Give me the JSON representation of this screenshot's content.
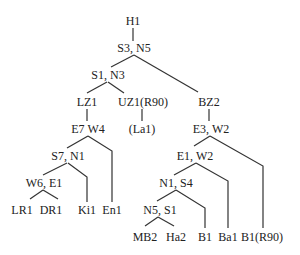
{
  "tree": {
    "nodes": [
      {
        "id": "h1",
        "label": "H1"
      },
      {
        "id": "s3n5",
        "label": "S3, N5"
      },
      {
        "id": "s1n3",
        "label": "S1, N3"
      },
      {
        "id": "lz1",
        "label": "LZ1"
      },
      {
        "id": "uz1",
        "label": "UZ1(R90)"
      },
      {
        "id": "bz2",
        "label": "BZ2"
      },
      {
        "id": "e7w4",
        "label": "E7 W4"
      },
      {
        "id": "la1",
        "label": "(La1)"
      },
      {
        "id": "e3w2",
        "label": "E3, W2"
      },
      {
        "id": "s7n1",
        "label": "S7, N1"
      },
      {
        "id": "e1w2",
        "label": "E1, W2"
      },
      {
        "id": "w6e1",
        "label": "W6, E1"
      },
      {
        "id": "n1s4",
        "label": "N1, S4"
      },
      {
        "id": "lr1",
        "label": "LR1"
      },
      {
        "id": "dr1",
        "label": "DR1"
      },
      {
        "id": "ki1",
        "label": "Ki1"
      },
      {
        "id": "en1",
        "label": "En1"
      },
      {
        "id": "n5s1",
        "label": "N5, S1"
      },
      {
        "id": "mb2",
        "label": "MB2"
      },
      {
        "id": "ha2",
        "label": "Ha2"
      },
      {
        "id": "b1",
        "label": "B1"
      },
      {
        "id": "ba1",
        "label": "Ba1"
      },
      {
        "id": "b1r90",
        "label": "B1(R90)"
      }
    ],
    "edges": [
      [
        "h1",
        "s3n5"
      ],
      [
        "s3n5",
        "s1n3"
      ],
      [
        "s3n5",
        "bz2"
      ],
      [
        "s1n3",
        "lz1"
      ],
      [
        "s1n3",
        "uz1"
      ],
      [
        "lz1",
        "e7w4"
      ],
      [
        "uz1",
        "la1"
      ],
      [
        "bz2",
        "e3w2"
      ],
      [
        "e7w4",
        "s7n1"
      ],
      [
        "e7w4",
        "en1"
      ],
      [
        "s7n1",
        "w6e1"
      ],
      [
        "s7n1",
        "ki1"
      ],
      [
        "w6e1",
        "lr1"
      ],
      [
        "w6e1",
        "dr1"
      ],
      [
        "e3w2",
        "e1w2"
      ],
      [
        "e3w2",
        "b1r90"
      ],
      [
        "e1w2",
        "n1s4"
      ],
      [
        "e1w2",
        "ba1"
      ],
      [
        "n1s4",
        "n5s1"
      ],
      [
        "n1s4",
        "b1"
      ],
      [
        "n5s1",
        "mb2"
      ],
      [
        "n5s1",
        "ha2"
      ]
    ]
  }
}
